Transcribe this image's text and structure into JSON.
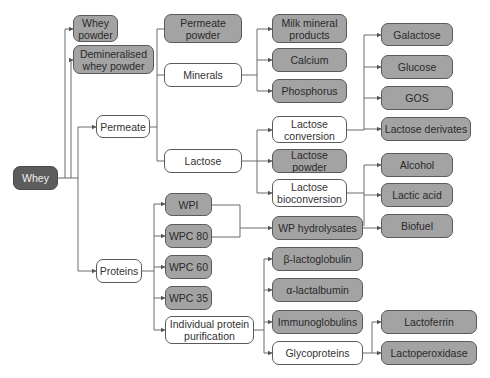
{
  "diagram": {
    "type": "flow-tree",
    "colors": {
      "root": "#5c5c5c",
      "product": "#a3a3a3",
      "intermediate": "#ffffff",
      "line": "#6a6a6a"
    },
    "nodes": {
      "whey": "Whey",
      "whey_powder": "Whey\npowder",
      "demin_whey_powder": "Demineralised\nwhey powder",
      "permeate": "Permeate",
      "proteins": "Proteins",
      "permeate_powder": "Permeate\npowder",
      "minerals": "Minerals",
      "lactose": "Lactose",
      "milk_mineral_products": "Milk mineral\nproducts",
      "calcium": "Calcium",
      "phosphorus": "Phosphorus",
      "lactose_conversion": "Lactose\nconversion",
      "lactose_powder": "Lactose powder",
      "lactose_bioconversion": "Lactose\nbioconversion",
      "wp_hydrolysates": "WP hydrolysates",
      "beta_lactoglobulin": "β-lactoglobulin",
      "alpha_lactalbumin": "α-lactalbumin",
      "immunoglobulins": "Immunoglobulins",
      "glycoproteins": "Glycoproteins",
      "wpi": "WPI",
      "wpc80": "WPC 80",
      "wpc60": "WPC 60",
      "wpc35": "WPC 35",
      "individual_protein_purification": "Individual protein\npurification",
      "galactose": "Galactose",
      "glucose": "Glucose",
      "gos": "GOS",
      "lactose_derivates": "Lactose derivates",
      "alcohol": "Alcohol",
      "lactic_acid": "Lactic acid",
      "biofuel": "Biofuel",
      "lactoferrin": "Lactoferrin",
      "lactoperoxidase": "Lactoperoxidase"
    },
    "edges": [
      [
        "Whey",
        "Whey powder"
      ],
      [
        "Whey",
        "Demineralised whey powder"
      ],
      [
        "Whey",
        "Permeate"
      ],
      [
        "Whey",
        "Proteins"
      ],
      [
        "Permeate",
        "Permeate powder"
      ],
      [
        "Permeate",
        "Minerals"
      ],
      [
        "Permeate",
        "Lactose"
      ],
      [
        "Minerals",
        "Milk mineral products"
      ],
      [
        "Minerals",
        "Calcium"
      ],
      [
        "Minerals",
        "Phosphorus"
      ],
      [
        "Lactose",
        "Lactose conversion"
      ],
      [
        "Lactose",
        "Lactose powder"
      ],
      [
        "Lactose",
        "Lactose bioconversion"
      ],
      [
        "Lactose conversion",
        "Galactose"
      ],
      [
        "Lactose conversion",
        "Glucose"
      ],
      [
        "Lactose conversion",
        "GOS"
      ],
      [
        "Lactose conversion",
        "Lactose derivates"
      ],
      [
        "Lactose bioconversion",
        "Alcohol"
      ],
      [
        "Lactose bioconversion",
        "Lactic acid"
      ],
      [
        "Lactose bioconversion",
        "Biofuel"
      ],
      [
        "Proteins",
        "WPI"
      ],
      [
        "Proteins",
        "WPC 80"
      ],
      [
        "Proteins",
        "WPC 60"
      ],
      [
        "Proteins",
        "WPC 35"
      ],
      [
        "Proteins",
        "Individual protein purification"
      ],
      [
        "WPI",
        "WP hydrolysates"
      ],
      [
        "WPC 80",
        "WP hydrolysates"
      ],
      [
        "Individual protein purification",
        "β-lactoglobulin"
      ],
      [
        "Individual protein purification",
        "α-lactalbumin"
      ],
      [
        "Individual protein purification",
        "Immunoglobulins"
      ],
      [
        "Individual protein purification",
        "Glycoproteins"
      ],
      [
        "Glycoproteins",
        "Lactoferrin"
      ],
      [
        "Glycoproteins",
        "Lactoperoxidase"
      ]
    ]
  }
}
